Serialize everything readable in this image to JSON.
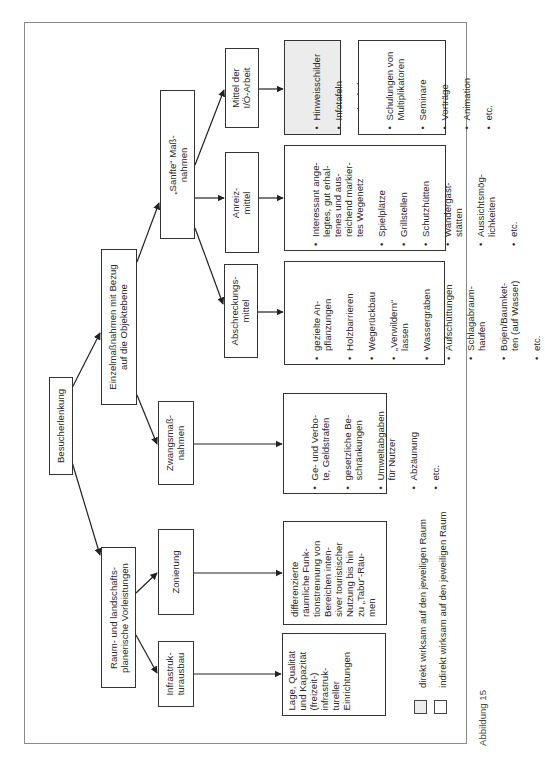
{
  "diagram": {
    "root": "Besucherlenkung",
    "level1": {
      "einzel": "Einzelmaßnahmen mit Bezug\nauf die Objektebene",
      "raum": "Raum- und landschafts-\nplanerische Vorleistungen"
    },
    "level2": {
      "sanfte": "„Sanfte“ Maß-\nnahmen",
      "zwang": "Zwangsmaß-\nnahmen",
      "zonierung": "Zonierung",
      "infra": "Infrastruk-\nturausbau"
    },
    "level3": {
      "mittel_io": "Mittel der\nI/Ö-Arbeit",
      "anreiz": "Anreiz-\nmittel",
      "abschreck": "Abschreckungs-\nmittel"
    },
    "details": {
      "hinweis": [
        "Hinweisschilder",
        "Infotafeln",
        "Lehrpfade",
        "etc."
      ],
      "schulungen": [
        "Schulungen von\nMultiplikatoren",
        "Seminare",
        "Vorträge",
        "Animation",
        "etc."
      ],
      "interessant": [
        "Interessant ange-\nlegtes, gut erhal-\ntenes und aus-\nreichend markier-\ntes Wegenetz",
        "Spielplätze",
        "Grillstellen",
        "Schutzhütten",
        "Wandergast-\nstätten",
        "Aussichtsmög-\nlichkeiten",
        "etc."
      ],
      "gezielte": [
        "gezielte An-\npflanzungen",
        "Holzbarrieren",
        "Wegerückbau",
        "„Verwildern“\nlassen",
        "Wassergräben",
        "Aufschüttungen",
        "Schlagabraum-\nhaufen",
        "Bojen/Baumket-\nten (auf Wasser)",
        "etc."
      ],
      "gebote": [
        "Ge- und Verbo-\nte, Geldstrafen",
        "gesetzliche Be-\nschränkungen",
        "Umweltabgaben\nfür Nutzer",
        "Abzäunung",
        "etc."
      ],
      "differenzierte": "differenzierte\nräumliche Funk-\ntionstrennung von\nBereichen inten-\nsiver touristischer\nNutzung bis hin\nzu „Tabu“-Räu-\nmen",
      "lage": "Lage, Qualität\nund Kapazität\n(freizeit-)\ninfrastruk-\ntureller\nEinrichtungen"
    },
    "legend": {
      "direct": "direkt wirksam auf den jeweiligen Raum",
      "indirect": "indirekt wirksam auf den jeweiligen Raum",
      "direct_color": "#ececec",
      "indirect_color": "#ffffff"
    },
    "caption": "Abbildung 15"
  }
}
